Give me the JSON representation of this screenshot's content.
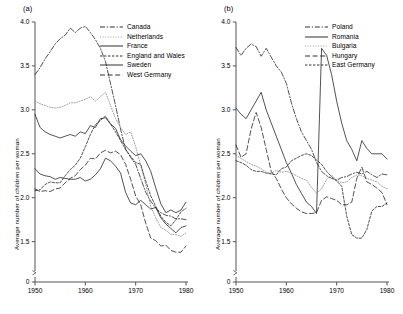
{
  "figure": {
    "panels": [
      {
        "id": "a",
        "label": "(a)",
        "ylabel": "Average number of children per woman",
        "xlabel": "",
        "yticks": [
          "0",
          "1.5",
          "2.0",
          "2.5",
          "3.0",
          "3.5",
          "4.0"
        ],
        "xticks": [
          "1950",
          "1960",
          "1970",
          "1980"
        ],
        "legend": [
          {
            "label": "Canada",
            "style": "dashdot"
          },
          {
            "label": "Netherlands",
            "style": "dotted"
          },
          {
            "label": "France",
            "style": "solid"
          },
          {
            "label": "England and Wales",
            "style": "shortdash"
          },
          {
            "label": "Sweden",
            "style": "solid"
          },
          {
            "label": "West Germany",
            "style": "longdash"
          }
        ]
      },
      {
        "id": "b",
        "label": "(b)",
        "ylabel": "Average number of children per woman",
        "xlabel": "",
        "yticks": [
          "0",
          "1.5",
          "2.0",
          "2.5",
          "3.0",
          "3.5",
          "4.0"
        ],
        "xticks": [
          "1950",
          "1960",
          "1970",
          "1980"
        ],
        "legend": [
          {
            "label": "Poland",
            "style": "dashdot"
          },
          {
            "label": "Romania",
            "style": "solid"
          },
          {
            "label": "Bulgaria",
            "style": "dotted"
          },
          {
            "label": "Hungary",
            "style": "longdash"
          },
          {
            "label": "East Germany",
            "style": "shortdash"
          }
        ]
      }
    ]
  },
  "chart_data": [
    {
      "type": "line",
      "title": "(a)",
      "xlabel": "",
      "ylabel": "Average number of children per woman",
      "xlim": [
        1950,
        1980
      ],
      "ylim": [
        1.2,
        4.0
      ],
      "yticks": [
        1.5,
        2.0,
        2.5,
        3.0,
        3.5,
        4.0
      ],
      "xticks": [
        1950,
        1960,
        1970,
        1980
      ],
      "grid": false,
      "legend_position": "top-right",
      "x": [
        1950,
        1951,
        1952,
        1953,
        1954,
        1955,
        1956,
        1957,
        1958,
        1959,
        1960,
        1961,
        1962,
        1963,
        1964,
        1965,
        1966,
        1967,
        1968,
        1969,
        1970,
        1971,
        1972,
        1973,
        1974,
        1975,
        1976,
        1977,
        1978,
        1979,
        1980
      ],
      "series": [
        {
          "name": "Canada",
          "style": "dashdot",
          "values": [
            3.4,
            3.48,
            3.58,
            3.66,
            3.75,
            3.81,
            3.85,
            3.93,
            3.88,
            3.93,
            3.95,
            3.88,
            3.8,
            3.7,
            3.55,
            3.3,
            3.05,
            2.78,
            2.55,
            2.46,
            2.38,
            2.22,
            2.06,
            1.96,
            1.88,
            1.83,
            1.8,
            1.79,
            1.76,
            1.76,
            1.75
          ]
        },
        {
          "name": "Netherlands",
          "style": "dotted",
          "values": [
            3.1,
            3.07,
            3.05,
            3.03,
            3.02,
            3.03,
            3.05,
            3.08,
            3.08,
            3.1,
            3.12,
            3.15,
            3.1,
            3.15,
            3.2,
            3.05,
            2.9,
            2.8,
            2.72,
            2.75,
            2.58,
            2.37,
            2.15,
            1.9,
            1.77,
            1.66,
            1.63,
            1.58,
            1.58,
            1.56,
            1.6
          ]
        },
        {
          "name": "France",
          "style": "solid",
          "values": [
            2.95,
            2.8,
            2.75,
            2.72,
            2.7,
            2.68,
            2.7,
            2.72,
            2.7,
            2.75,
            2.73,
            2.82,
            2.8,
            2.9,
            2.91,
            2.84,
            2.79,
            2.66,
            2.59,
            2.53,
            2.48,
            2.5,
            2.42,
            2.3,
            2.11,
            1.93,
            1.83,
            1.86,
            1.83,
            1.86,
            1.95
          ]
        },
        {
          "name": "England and Wales",
          "style": "shortdash",
          "values": [
            2.08,
            2.09,
            2.15,
            2.18,
            2.17,
            2.17,
            2.25,
            2.32,
            2.37,
            2.45,
            2.58,
            2.72,
            2.83,
            2.88,
            2.93,
            2.84,
            2.75,
            2.65,
            2.55,
            2.47,
            2.4,
            2.38,
            2.19,
            2.02,
            1.9,
            1.79,
            1.72,
            1.68,
            1.75,
            1.84,
            1.88
          ]
        },
        {
          "name": "Sweden",
          "style": "solid",
          "values": [
            2.33,
            2.27,
            2.25,
            2.24,
            2.21,
            2.23,
            2.22,
            2.21,
            2.21,
            2.23,
            2.19,
            2.21,
            2.26,
            2.33,
            2.45,
            2.42,
            2.36,
            2.28,
            2.06,
            1.94,
            1.92,
            1.97,
            1.92,
            1.87,
            1.89,
            1.77,
            1.7,
            1.65,
            1.6,
            1.66,
            1.68
          ]
        },
        {
          "name": "West Germany",
          "style": "longdash",
          "values": [
            2.1,
            2.07,
            2.08,
            2.07,
            2.1,
            2.11,
            2.17,
            2.22,
            2.25,
            2.32,
            2.37,
            2.45,
            2.44,
            2.51,
            2.54,
            2.51,
            2.53,
            2.49,
            2.38,
            2.21,
            2.02,
            1.92,
            1.71,
            1.54,
            1.51,
            1.45,
            1.46,
            1.4,
            1.38,
            1.38,
            1.45
          ]
        }
      ]
    },
    {
      "type": "line",
      "title": "(b)",
      "xlabel": "",
      "ylabel": "Average number of children per woman",
      "xlim": [
        1950,
        1980
      ],
      "ylim": [
        1.2,
        4.0
      ],
      "yticks": [
        1.5,
        2.0,
        2.5,
        3.0,
        3.5,
        4.0
      ],
      "xticks": [
        1950,
        1960,
        1970,
        1980
      ],
      "grid": false,
      "legend_position": "top-right",
      "x": [
        1950,
        1951,
        1952,
        1953,
        1954,
        1955,
        1956,
        1957,
        1958,
        1959,
        1960,
        1961,
        1962,
        1963,
        1964,
        1965,
        1966,
        1967,
        1968,
        1969,
        1970,
        1971,
        1972,
        1973,
        1974,
        1975,
        1976,
        1977,
        1978,
        1979,
        1980
      ],
      "series": [
        {
          "name": "Poland",
          "style": "dashdot",
          "values": [
            3.71,
            3.62,
            3.7,
            3.75,
            3.72,
            3.61,
            3.7,
            3.6,
            3.5,
            3.43,
            3.3,
            3.08,
            2.9,
            2.75,
            2.65,
            2.55,
            2.4,
            2.3,
            2.25,
            2.22,
            2.2,
            2.23,
            2.24,
            2.27,
            2.29,
            2.27,
            2.3,
            2.26,
            2.23,
            2.27,
            2.26
          ]
        },
        {
          "name": "Romania",
          "style": "solid",
          "values": [
            3.02,
            2.95,
            2.9,
            3.0,
            3.1,
            3.2,
            3.0,
            2.85,
            2.7,
            2.55,
            2.4,
            2.28,
            2.15,
            2.05,
            1.95,
            1.9,
            1.82,
            3.7,
            3.62,
            3.4,
            3.1,
            2.85,
            2.65,
            2.55,
            2.42,
            2.65,
            2.56,
            2.5,
            2.5,
            2.5,
            2.44
          ]
        },
        {
          "name": "Bulgaria",
          "style": "dotted",
          "values": [
            2.48,
            2.45,
            2.41,
            2.38,
            2.36,
            2.33,
            2.29,
            2.28,
            2.31,
            2.29,
            2.3,
            2.28,
            2.25,
            2.22,
            2.2,
            2.12,
            2.05,
            2.1,
            2.21,
            2.26,
            2.2,
            2.17,
            2.18,
            2.23,
            2.26,
            2.25,
            2.22,
            2.2,
            2.18,
            2.13,
            2.1
          ]
        },
        {
          "name": "Hungary",
          "style": "longdash",
          "values": [
            2.6,
            2.46,
            2.5,
            2.78,
            2.97,
            2.8,
            2.55,
            2.3,
            2.22,
            2.1,
            2.0,
            1.93,
            1.88,
            1.84,
            1.82,
            1.82,
            1.83,
            1.97,
            2.01,
            1.99,
            1.97,
            1.92,
            1.92,
            1.95,
            2.22,
            2.35,
            2.18,
            2.15,
            2.11,
            2.06,
            1.92
          ]
        },
        {
          "name": "East Germany",
          "style": "shortdash",
          "values": [
            2.42,
            2.4,
            2.37,
            2.32,
            2.3,
            2.3,
            2.28,
            2.27,
            2.26,
            2.33,
            2.35,
            2.42,
            2.45,
            2.48,
            2.5,
            2.48,
            2.43,
            2.38,
            2.3,
            2.24,
            2.19,
            2.13,
            1.79,
            1.58,
            1.54,
            1.54,
            1.64,
            1.85,
            1.9,
            1.9,
            1.94
          ]
        }
      ]
    }
  ]
}
